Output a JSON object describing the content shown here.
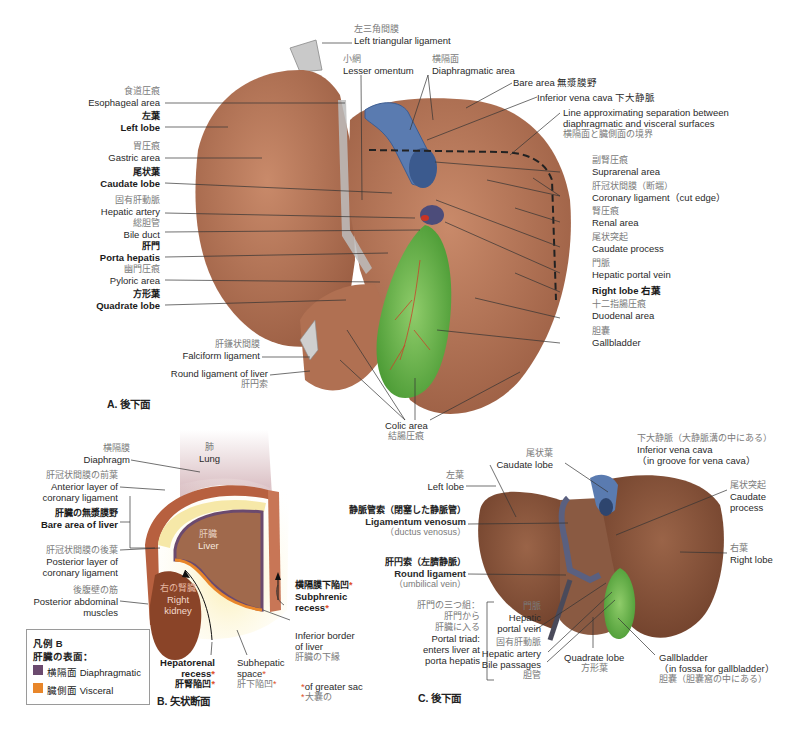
{
  "panel_a": {
    "caption": "A.  後下面",
    "labels": {
      "left_triangular_ligament": {
        "jp": "左三角間膜",
        "en": "Left triangular ligament"
      },
      "lesser_omentum": {
        "jp": "小網",
        "en": "Lesser omentum"
      },
      "diaphragmatic_area": {
        "jp": "横隔面",
        "en": "Diaphragmatic area"
      },
      "bare_area": {
        "en": "Bare area 無漿膜野"
      },
      "ivc": {
        "en": "Inferior vena cava 下大静脈"
      },
      "line_sep": {
        "en1": "Line approximating separation between",
        "en2": "diaphragmatic and visceral surfaces",
        "jp": "横隔面と臓側面の境界"
      },
      "esophageal_area": {
        "jp": "食道圧痕",
        "en": "Esophageal area"
      },
      "left_lobe": {
        "jp": "左葉",
        "en": "Left lobe"
      },
      "gastric_area": {
        "jp": "胃圧痕",
        "en": "Gastric area"
      },
      "caudate_lobe": {
        "jp": "尾状葉",
        "en": "Caudate lobe"
      },
      "hepatic_artery": {
        "jp": "固有肝動脈",
        "en": "Hepatic artery"
      },
      "bile_duct": {
        "jp": "総胆管",
        "en": "Bile duct"
      },
      "porta_hepatis": {
        "jp": "肝門",
        "en": "Porta hepatis"
      },
      "pyloric_area": {
        "jp": "幽門圧痕",
        "en": "Pyloric area"
      },
      "quadrate_lobe": {
        "jp": "方形葉",
        "en": "Quadrate lobe"
      },
      "falciform_ligament": {
        "jp": "肝鎌状間膜",
        "en": "Falciform ligament"
      },
      "round_ligament": {
        "en": "Round ligament of liver",
        "jp": "肝円索"
      },
      "suprarenal_area": {
        "jp": "副腎圧痕",
        "en": "Suprarenal area"
      },
      "coronary_ligament": {
        "jp": "肝冠状間膜（断端）",
        "en": "Coronary ligament（cut edge）"
      },
      "renal_area": {
        "jp": "腎圧痕",
        "en": "Renal area"
      },
      "caudate_process": {
        "jp": "尾状突起",
        "en": "Caudate process"
      },
      "portal_vein": {
        "jp": "門脈",
        "en": "Hepatic portal vein"
      },
      "right_lobe": {
        "en": "Right lobe 右葉"
      },
      "duodenal_area": {
        "jp": "十二指腸圧痕",
        "en": "Duodenal area"
      },
      "gallbladder": {
        "jp": "胆嚢",
        "en": "Gallbladder"
      },
      "colic_area": {
        "en": "Colic area",
        "jp": "結腸圧痕"
      }
    }
  },
  "panel_b": {
    "caption": "B.  矢状断面",
    "labels": {
      "lung": {
        "jp": "肺",
        "en": "Lung"
      },
      "diaphragm": {
        "jp": "横隔膜",
        "en": "Diaphragm"
      },
      "anterior_layer": {
        "jp": "肝冠状間膜の前葉",
        "en1": "Anterior layer of",
        "en2": "coronary ligament"
      },
      "bare_area_liver": {
        "jp": "肝臓の無漿膜野",
        "en": "Bare area of liver"
      },
      "liver": {
        "jp": "肝臓",
        "en": "Liver"
      },
      "posterior_layer": {
        "jp": "肝冠状間膜の後葉",
        "en1": "Posterior layer of",
        "en2": "coronary ligament"
      },
      "post_abd_muscles": {
        "jp": "後腹壁の筋",
        "en1": "Posterior abdominal",
        "en2": "muscles"
      },
      "right_kidney": {
        "jp": "右の腎臓",
        "en1": "Right",
        "en2": "kidney"
      },
      "subphrenic": {
        "jp": "横隔膜下陥凹",
        "en1": "Subphrenic",
        "en2": "recess"
      },
      "inferior_border": {
        "en1": "Inferior border",
        "en2": "of liver",
        "jp": "肝臓の下縁"
      },
      "hepatorenal": {
        "en1": "Hepatorenal",
        "en2": "recess",
        "jp": "肝腎陥凹"
      },
      "subhepatic": {
        "en1": "Subhepatic",
        "en2": "space",
        "jp": "肝下陥凹"
      },
      "star_note": {
        "en": "of greater sac",
        "jp": "大嚢の"
      },
      "star": "*"
    },
    "legend": {
      "title": "凡例 B",
      "subtitle": "肝臓の表面：",
      "items": [
        {
          "label": "横隔面 Diaphragmatic",
          "color": "#6b4a6e"
        },
        {
          "label": "臓側面 Visceral",
          "color": "#e8862a"
        }
      ]
    }
  },
  "panel_c": {
    "caption": "C.  後下面",
    "labels": {
      "ivc": {
        "jp": "下大静脈（大静脈溝の中にある）",
        "en1": "Inferior vena cava",
        "en2": "（in groove for vena cava）"
      },
      "caudate_lobe": {
        "jp": "尾状葉",
        "en": "Caudate lobe"
      },
      "left_lobe": {
        "jp": "左葉",
        "en": "Left lobe"
      },
      "caudate_process": {
        "jp": "尾状突起",
        "en1": "Caudate",
        "en2": "process"
      },
      "lig_venosum": {
        "jp": "静脈管索（閉塞した静脈管）",
        "en": "Ligamentum venosum",
        "en2": "（ductus venosus）"
      },
      "right_lobe": {
        "jp": "右葉",
        "en": "Right lobe"
      },
      "round_lig": {
        "jp": "肝円索（左臍静脈）",
        "en": "Round ligament",
        "en2": "（umbilical vein）"
      },
      "portal_triad": {
        "jp1": "肝門の三つ組：",
        "jp2": "肝門から",
        "jp3": "肝臓に入る",
        "en1": "Portal triad:",
        "en2": "enters liver at",
        "en3": "porta hepatis"
      },
      "portal_vein": {
        "jp": "門脈",
        "en1": "Hepatic",
        "en2": "portal vein"
      },
      "hepatic_artery": {
        "jp": "固有肝動脈",
        "en": "Hepatic artery"
      },
      "bile_passages": {
        "en": "Bile passages",
        "jp": "胆管"
      },
      "quadrate_lobe": {
        "en": "Quadrate lobe",
        "jp": "方形葉"
      },
      "gallbladder": {
        "en1": "Gallbladder",
        "en2": "（in fossa for gallbladder）",
        "jp": "胆嚢（胆嚢窩の中にある）"
      }
    }
  },
  "colors": {
    "liver": "#b9785a",
    "liver_dark": "#8a5038",
    "ivc": "#5a7bb0",
    "gallbladder": "#6ab04a",
    "ligament": "#c8c8c8",
    "accent_star": "#e0502a",
    "peritoneum": "#f6e8a8",
    "lung": "#d9bfc4"
  }
}
